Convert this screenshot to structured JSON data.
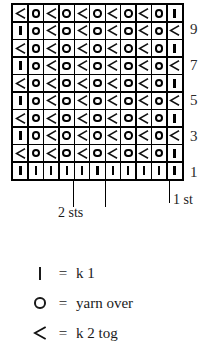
{
  "chart_data": {
    "type": "table",
    "columns": 11,
    "rows": 10,
    "symbol_keys": [
      "knit",
      "yo",
      "k2tog"
    ],
    "row_order_bottom_to_top": true,
    "grid_bottom_to_top": [
      [
        "knit",
        "knit",
        "knit",
        "knit",
        "knit",
        "knit",
        "knit",
        "knit",
        "knit",
        "knit",
        "knit"
      ],
      [
        "k2tog",
        "yo",
        "k2tog",
        "yo",
        "k2tog",
        "yo",
        "k2tog",
        "yo",
        "k2tog",
        "yo",
        "knit"
      ],
      [
        "knit",
        "yo",
        "k2tog",
        "yo",
        "k2tog",
        "yo",
        "k2tog",
        "yo",
        "k2tog",
        "yo",
        "k2tog"
      ],
      [
        "k2tog",
        "yo",
        "k2tog",
        "yo",
        "k2tog",
        "yo",
        "k2tog",
        "yo",
        "k2tog",
        "yo",
        "knit"
      ],
      [
        "knit",
        "yo",
        "k2tog",
        "yo",
        "k2tog",
        "yo",
        "k2tog",
        "yo",
        "k2tog",
        "yo",
        "k2tog"
      ],
      [
        "k2tog",
        "yo",
        "k2tog",
        "yo",
        "k2tog",
        "yo",
        "k2tog",
        "yo",
        "k2tog",
        "yo",
        "knit"
      ],
      [
        "knit",
        "yo",
        "k2tog",
        "yo",
        "k2tog",
        "yo",
        "k2tog",
        "yo",
        "k2tog",
        "yo",
        "k2tog"
      ],
      [
        "k2tog",
        "yo",
        "k2tog",
        "yo",
        "k2tog",
        "yo",
        "k2tog",
        "yo",
        "k2tog",
        "yo",
        "knit"
      ],
      [
        "knit",
        "yo",
        "k2tog",
        "yo",
        "k2tog",
        "yo",
        "k2tog",
        "yo",
        "k2tog",
        "yo",
        "k2tog"
      ],
      [
        "k2tog",
        "yo",
        "k2tog",
        "yo",
        "k2tog",
        "yo",
        "k2tog",
        "yo",
        "k2tog",
        "yo",
        "knit"
      ]
    ],
    "row_labels": [
      {
        "row": 9,
        "label": "9"
      },
      {
        "row": 7,
        "label": "7"
      },
      {
        "row": 5,
        "label": "5"
      },
      {
        "row": 3,
        "label": "3"
      },
      {
        "row": 1,
        "label": "1"
      }
    ],
    "repeat_markers": [
      {
        "label": "2 sts",
        "columns_spanned": 2
      },
      {
        "label": "1 st",
        "columns_spanned": 1
      }
    ]
  },
  "annotations": {
    "repeat_two_sts": "2 sts",
    "edge_one_st": "1 st"
  },
  "legend": {
    "items": [
      {
        "symbol": "knit",
        "equals": "=",
        "text": "k 1"
      },
      {
        "symbol": "yo",
        "equals": "=",
        "text": "yarn over"
      },
      {
        "symbol": "k2tog",
        "equals": "=",
        "text": "k 2 tog"
      }
    ]
  },
  "colors": {
    "ink": "#1a1a1a",
    "grid_line": "#000000",
    "background": "#ffffff",
    "row_label": "#2b2b2b"
  }
}
